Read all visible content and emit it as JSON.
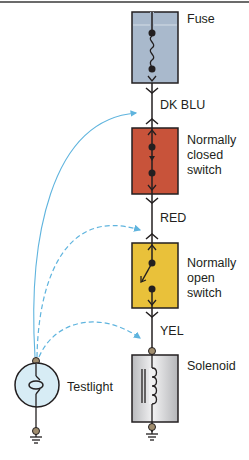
{
  "components": {
    "fuse": {
      "label": "Fuse",
      "color": "#a9b9cc"
    },
    "wire1": {
      "label": "DK BLU"
    },
    "closed_switch": {
      "label": "Normally\nclosed\nswitch",
      "color": "#c8533a"
    },
    "wire2": {
      "label": "RED"
    },
    "open_switch": {
      "label": "Normally\nopen\nswitch",
      "color": "#e9c13a"
    },
    "wire3": {
      "label": "YEL"
    },
    "solenoid": {
      "label": "Solenoid",
      "color": "#d4d5d7"
    },
    "testlight": {
      "label": "Testlight",
      "color": "#d7ecf5"
    }
  },
  "probe_color": "#5fb4de",
  "line_color": "#231f20"
}
